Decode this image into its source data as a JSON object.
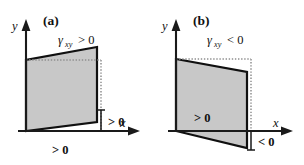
{
  "figure": {
    "kind": "engineering-mechanics-diagram",
    "background_color": "#ffffff",
    "shape_fill_color": "#c8c8c8",
    "line_color": "#101010",
    "dotted_reference_color": "#8e8e8e"
  },
  "panels": [
    {
      "id": "a",
      "tag": "(a)",
      "strain_symbol": "γ",
      "strain_subscript": "xy",
      "strain_relation": "> 0",
      "axis_x_label": "x",
      "axis_y_label": "y",
      "horizontal_annotation": "> 0",
      "vertical_annotation": "> 0"
    },
    {
      "id": "b",
      "tag": "(b)",
      "strain_symbol": "γ",
      "strain_subscript": "xy",
      "strain_relation": "< 0",
      "axis_x_label": "x",
      "axis_y_label": "y",
      "horizontal_annotation": "> 0",
      "vertical_annotation": "< 0"
    }
  ]
}
